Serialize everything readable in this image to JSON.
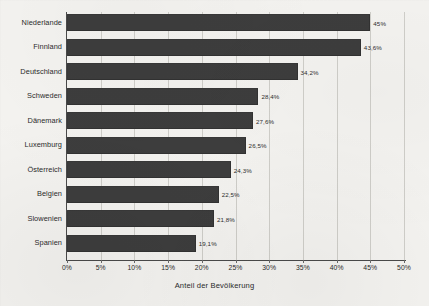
{
  "chart_data": {
    "type": "bar",
    "orientation": "horizontal",
    "title": "",
    "xlabel": "Anteil der Bevölkerung",
    "ylabel": "",
    "xlim": [
      0,
      50
    ],
    "xtick_step": 5,
    "grid": "vertical",
    "legend": "none",
    "bar_color": "#3d3d3d",
    "categories": [
      "Niederlande",
      "Finnland",
      "Deutschland",
      "Schweden",
      "Dänemark",
      "Luxemburg",
      "Österreich",
      "Belgien",
      "Slowenien",
      "Spanien"
    ],
    "values": [
      45,
      43.6,
      34.2,
      28.4,
      27.6,
      26.5,
      24.3,
      22.5,
      21.8,
      19.1
    ],
    "value_labels": [
      "45%",
      "43,6%",
      "34,2%",
      "28,4%",
      "27,6%",
      "26,5%",
      "24,3%",
      "22,5%",
      "21,8%",
      "19,1%"
    ],
    "xticks": [
      0,
      5,
      10,
      15,
      20,
      25,
      30,
      35,
      40,
      45,
      50
    ],
    "xtick_labels": [
      "0%",
      "5%",
      "10%",
      "15%",
      "20%",
      "25%",
      "30%",
      "35%",
      "40%",
      "45%",
      "50%"
    ]
  }
}
